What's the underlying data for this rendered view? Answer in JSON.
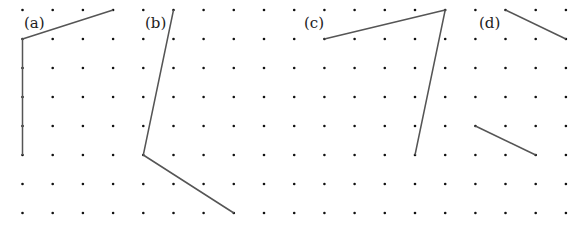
{
  "figure": {
    "grid": {
      "columns": 19,
      "rows": 8,
      "origin_x": 22.5,
      "origin_y": 10,
      "spacing_x": 30.19,
      "spacing_y": 29,
      "dot_color": "#111111",
      "dot_radius": 1.3
    },
    "line_color": "#555555",
    "panels": [
      {
        "label": "(a)",
        "label_pos": [
          24,
          28
        ],
        "paths": [
          [
            [
              3,
              0
            ],
            [
              0,
              1
            ],
            [
              0,
              5
            ]
          ]
        ]
      },
      {
        "label": "(b)",
        "label_pos": [
          145,
          28
        ],
        "paths": [
          [
            [
              5,
              0
            ],
            [
              4,
              5
            ],
            [
              7,
              7
            ]
          ]
        ]
      },
      {
        "label": "(c)",
        "label_pos": [
          304,
          28
        ],
        "paths": [
          [
            [
              10,
              1
            ],
            [
              14,
              0
            ],
            [
              13,
              5
            ]
          ]
        ]
      },
      {
        "label": "(d)",
        "label_pos": [
          479,
          28
        ],
        "paths": [
          [
            [
              16,
              0
            ],
            [
              18,
              1
            ]
          ],
          [
            [
              15,
              4
            ],
            [
              17,
              5
            ]
          ]
        ]
      }
    ]
  }
}
